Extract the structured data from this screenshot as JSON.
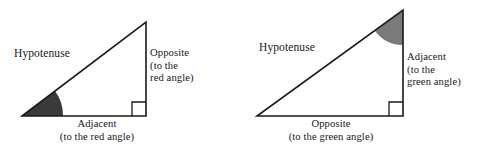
{
  "figure": {
    "background_color": "#ffffff",
    "stroke_color": "#1a1a1a",
    "red_angle_fill": "#3a3a3a",
    "green_angle_fill": "#7a7a7a"
  },
  "triangles": [
    {
      "id": "red-angle-triangle",
      "reference_angle_name": "red angle",
      "reference_angle_vertex": "bottom-left",
      "reference_angle_fill": "#3a3a3a",
      "geometry": {
        "bottom_left": [
          22,
          116
        ],
        "bottom_right": [
          146,
          116
        ],
        "apex": [
          146,
          22
        ],
        "right_angle_vertex": "bottom-right"
      },
      "labels": {
        "hypotenuse": "Hypotenuse",
        "opposite": "Opposite\n(to the\nred angle)",
        "adjacent": "Adjacent\n(to the red angle)"
      }
    },
    {
      "id": "green-angle-triangle",
      "reference_angle_name": "green angle",
      "reference_angle_vertex": "top",
      "reference_angle_fill": "#7a7a7a",
      "geometry": {
        "bottom_left": [
          257,
          116
        ],
        "bottom_right": [
          403,
          116
        ],
        "apex": [
          403,
          10
        ],
        "right_angle_vertex": "bottom-right"
      },
      "labels": {
        "hypotenuse": "Hypotenuse",
        "adjacent": "Adjacent\n(to the\ngreen angle)",
        "opposite": "Opposite\n(to the green angle)"
      }
    }
  ]
}
